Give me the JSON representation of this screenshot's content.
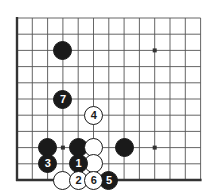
{
  "figure": {
    "kind": "go-board-diagram",
    "background_color": "#ffffff",
    "line_color": "#555555",
    "edge_color": "#333333",
    "black_color": "#1a1a1a",
    "white_color": "#ffffff"
  },
  "board": {
    "origin_x": 17,
    "origin_y": 18,
    "step_x": 15.3,
    "step_y": 16.2,
    "cols": 13,
    "rows": 11,
    "edge_left": true,
    "edge_bottom": true,
    "stone_radius": 9.5
  },
  "star_points": [
    {
      "name": "star-point-upper-right",
      "col": 9,
      "row": 2
    },
    {
      "name": "star-point-lower-left",
      "col": 3,
      "row": 8
    },
    {
      "name": "star-point-lower-right",
      "col": 9,
      "row": 8
    }
  ],
  "stones": [
    {
      "name": "black-stone-upper-left",
      "color": "black",
      "label": "",
      "col": 3,
      "row": 2
    },
    {
      "name": "black-stone-right-side",
      "color": "black",
      "label": "",
      "col": 7,
      "row": 8
    },
    {
      "name": "black-stone-left-side",
      "color": "black",
      "label": "",
      "col": 2,
      "row": 8
    },
    {
      "name": "black-stone-center",
      "color": "black",
      "label": "",
      "col": 4,
      "row": 8
    },
    {
      "name": "white-stone-right-of-center",
      "color": "white",
      "label": "",
      "col": 5,
      "row": 8
    },
    {
      "name": "white-stone-below-right",
      "color": "white",
      "label": "",
      "col": 5,
      "row": 9
    },
    {
      "name": "white-stone-bottom-left",
      "color": "white",
      "label": "",
      "col": 3,
      "row": 10
    },
    {
      "name": "move-stone-1",
      "color": "black",
      "label": "1",
      "col": 4,
      "row": 9
    },
    {
      "name": "move-stone-2",
      "color": "white",
      "label": "2",
      "col": 4,
      "row": 10
    },
    {
      "name": "move-stone-3",
      "color": "black",
      "label": "3",
      "col": 2,
      "row": 9
    },
    {
      "name": "move-stone-4",
      "color": "white",
      "label": "4",
      "col": 5,
      "row": 6
    },
    {
      "name": "move-stone-5",
      "color": "black",
      "label": "5",
      "col": 6,
      "row": 10
    },
    {
      "name": "move-stone-6",
      "color": "white",
      "label": "6",
      "col": 5,
      "row": 10
    },
    {
      "name": "move-stone-7",
      "color": "black",
      "label": "7",
      "col": 3,
      "row": 5
    }
  ]
}
